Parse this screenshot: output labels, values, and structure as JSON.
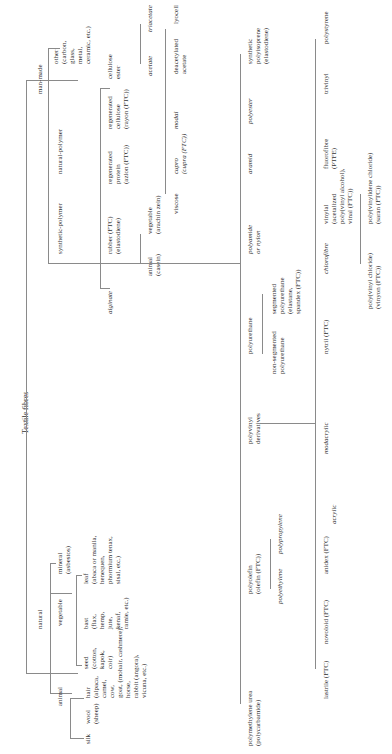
{
  "diagram": {
    "title": "Textile fibres",
    "orientation": "rotated 90 degrees (text reads bottom-to-top)",
    "nodes": {
      "root": "Textile fibres",
      "natural": "natural",
      "man_made": "man-made",
      "animal": "animal",
      "vegetable": "vegetable",
      "mineral": "mineral\n(asbestos)",
      "silk": "silk",
      "wool": "wool\n(sheep)",
      "hair": "hair\n(alpaca,\ncamel,\ncow,\ngoat, (mohair, cashmere),\nhorse,\nrabbit (angora),\nvicuna, etc.)",
      "seed": "seed\n(cotton,\nkapok,\ncoir)",
      "bast": "bast\n(flax,\nhemp,\njute,\nkenaf,\nramie, etc.)",
      "leaf": "leaf\n(abaca or manila,\nhenequen,\nphormium tenax,\nsisal, etc.)",
      "synthetic_polymer": "synthetic-polymer",
      "natural_polymer": "natural-polymer",
      "other": "other\n(carbon,\nglass,\nmetal,\nceramic, etc.)",
      "alginate": "alginate",
      "rubber": "rubber (FTC)\n(elastodiene)",
      "regenerated_protein": "regenerated\nprotein\n(azlon (FTC))",
      "regenerated_cellulose": "regenerated\ncellulose\n(rayon (FTC))",
      "cellulose_ester": "cellulose\nester",
      "animal_casein": "animal\n(casein)",
      "vegetable_zein": "vegetable\n(arachin zein)",
      "viscose": "viscose",
      "cupro": "cupro\n(cupra (FTC))",
      "modal": "modal",
      "deacetylated_acetate": "deacetylated\nacetate",
      "lyocell": "lyocell",
      "acetate": "acetate",
      "triacetate": "triacetate",
      "polymethylene_urea": "polymethylene urea\n(polycarbamide)",
      "polyolefin": "polyolefin\n(olefin (FTC))",
      "polyethylene": "polyethylene",
      "polypropylene": "polypropylene",
      "polyvinyl_derivatives": "polyvinyl\nderivatives",
      "polyurethane": "polyurethane",
      "non_segmented_polyurethane": "non-segmented\npolyurethane",
      "segmented_polyurethane": "segmented\npolyurethane\n(elastane,\nspandex (FTC))",
      "polyamide": "polyamide\nor nylon",
      "aramid": "aramid",
      "polyester": "polyester",
      "synthetic_polyisoprene": "synthetic\npolyisoprene\n(elastodiene)",
      "lastrile": "lastrile (FTC)",
      "novoloid": "novoloid (FTC)",
      "anidex": "anidex (FTC)",
      "acrylic": "acrylic",
      "modacrylic": "modacrylic",
      "nytril": "nytril (FTC)",
      "chlorofibre": "chlorofibre",
      "vinylal": "vinylal\n(acetalized\npoly(vinyl alcohol),\nvinal (FTC))",
      "fluorofibre": "fluorofibre\n(PTFE)",
      "trivinyl": "trivinyl",
      "polystyrene": "polystyrene",
      "polyvinyl_chloride": "poly(vinyl chloride)\n(vinyon (FTC))",
      "polyvinylidene_chloride": "poly(vinylidene chloride)\n(saran (FTC))"
    },
    "colors": {
      "line": "#8a8a8a",
      "text": "#333333",
      "background": "#ffffff"
    }
  }
}
